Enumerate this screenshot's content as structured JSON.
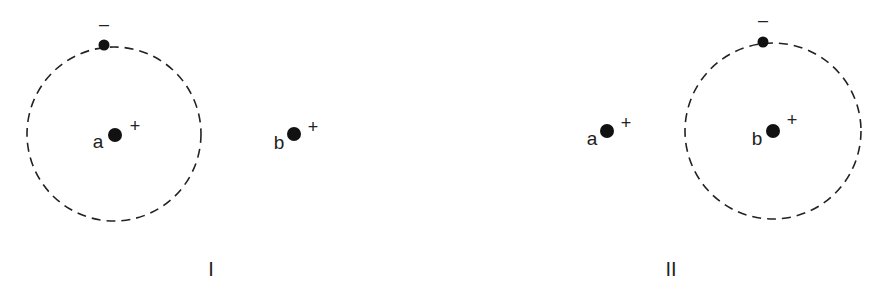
{
  "colors": {
    "background": "#ffffff",
    "ink": "#222222"
  },
  "panels": [
    {
      "label": "I",
      "orbit": {
        "cx": 114,
        "cy": 134,
        "r": 87,
        "style": "dashed"
      },
      "electron": {
        "x": 104,
        "y": 45,
        "charge": "–"
      },
      "nuclei": [
        {
          "name": "a",
          "x": 115,
          "y": 135,
          "charge": "+"
        },
        {
          "name": "b",
          "x": 294,
          "y": 134,
          "charge": "+"
        }
      ]
    },
    {
      "label": "II",
      "orbit": {
        "cx": 773,
        "cy": 131,
        "r": 88,
        "style": "dashed"
      },
      "electron": {
        "x": 763,
        "y": 42,
        "charge": "–"
      },
      "nuclei": [
        {
          "name": "a",
          "x": 607,
          "y": 131,
          "charge": "+"
        },
        {
          "name": "b",
          "x": 773,
          "y": 131,
          "charge": "+"
        }
      ]
    }
  ]
}
